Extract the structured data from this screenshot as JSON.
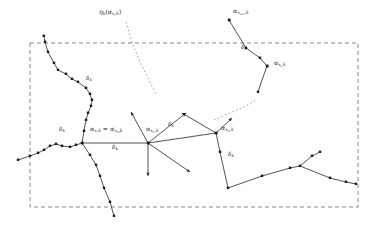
{
  "figure": {
    "type": "mathematical-diagram",
    "background_color": "#ffffff",
    "stroke_color": "#1a1a1a",
    "dashed_border_color": "#555555"
  },
  "labels": {
    "annotation_eta": "ηₖ(αₓ,ₖ)",
    "node_x_i_plus_1": "αₓᵢ₊₁,ₖ",
    "node_x_i": "αₓᵢ,ₖ",
    "node_root": "αₓ,ₖ = αₓ₀,ₖ",
    "node_x_1": "αₓ₁,ₖ",
    "node_x_2": "αₓ₂,ₖ",
    "delta_left_lower": "δₖ",
    "delta_left_upper": "δₖ",
    "delta_root_edge": "δₖ",
    "delta_mid_edge": "δₖ",
    "delta_right_vertical": "δₖ",
    "delta_top_right": "δₖ"
  },
  "label_parts": {
    "eta_base": "η",
    "eta_sub": "k",
    "alpha": "α",
    "delta": "δ",
    "sub_k": "k",
    "sub_x": "x",
    "sub_x0": "x",
    "sub_0": "0",
    "sub_1": "1",
    "sub_2": "2",
    "sub_i": "i",
    "sub_i_plus_1": "i+1",
    "equals": "="
  },
  "geometry": {
    "dashed_box": {
      "x": 30,
      "y": 43,
      "width": 328,
      "height": 164
    },
    "nodes": [
      {
        "name": "root",
        "x": 82,
        "y": 143
      },
      {
        "name": "x1",
        "x": 148,
        "y": 143
      },
      {
        "name": "x2",
        "x": 216,
        "y": 133
      },
      {
        "name": "xi",
        "x": 267,
        "y": 66
      },
      {
        "name": "xi_plus_1",
        "x": 229,
        "y": 20
      }
    ]
  }
}
